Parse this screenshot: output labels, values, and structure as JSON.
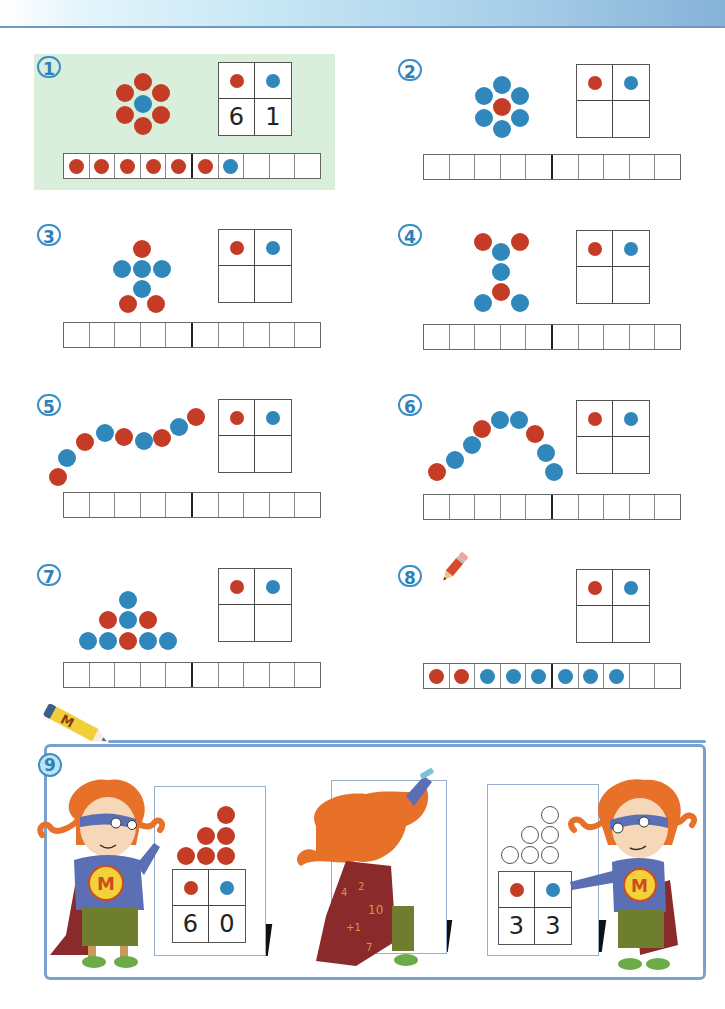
{
  "header": {
    "gradient_colors": [
      "#ffffff",
      "#c9e8f5",
      "#86b2d8"
    ]
  },
  "colors": {
    "red": "#c43c25",
    "blue": "#2f87bb",
    "highlight_bg": "#d9eedb",
    "number_circle": "#3a8fc7",
    "frame": "#7aa0cf"
  },
  "exercises": [
    {
      "number": "1",
      "highlighted": true,
      "pattern": "flower",
      "dots": "6 red + 1 blue",
      "table_header": [
        "red-dot",
        "blue-dot"
      ],
      "table_values": [
        "6",
        "1"
      ],
      "strip": [
        "red",
        "red",
        "red",
        "red",
        "red",
        "red",
        "blue",
        "",
        "",
        ""
      ]
    },
    {
      "number": "2",
      "highlighted": false,
      "pattern": "flower",
      "dots": "1 red + 6 blue",
      "table_header": [
        "red-dot",
        "blue-dot"
      ],
      "table_values": [
        "",
        ""
      ],
      "strip": [
        "",
        "",
        "",
        "",
        "",
        "",
        "",
        "",
        "",
        ""
      ]
    },
    {
      "number": "3",
      "highlighted": false,
      "pattern": "figure",
      "dots": "3 red + 4 blue",
      "table_header": [
        "red-dot",
        "blue-dot"
      ],
      "table_values": [
        "",
        ""
      ],
      "strip": [
        "",
        "",
        "",
        "",
        "",
        "",
        "",
        "",
        "",
        ""
      ]
    },
    {
      "number": "4",
      "highlighted": false,
      "pattern": "hourglass",
      "dots": "3 red + 4 blue",
      "table_header": [
        "red-dot",
        "blue-dot"
      ],
      "table_values": [
        "",
        ""
      ],
      "strip": [
        "",
        "",
        "",
        "",
        "",
        "",
        "",
        "",
        "",
        ""
      ]
    },
    {
      "number": "5",
      "highlighted": false,
      "pattern": "wave",
      "dots": "5 red + 4 blue",
      "table_header": [
        "red-dot",
        "blue-dot"
      ],
      "table_values": [
        "",
        ""
      ],
      "strip": [
        "",
        "",
        "",
        "",
        "",
        "",
        "",
        "",
        "",
        ""
      ]
    },
    {
      "number": "6",
      "highlighted": false,
      "pattern": "arc",
      "dots": "3 red + 6 blue",
      "table_header": [
        "red-dot",
        "blue-dot"
      ],
      "table_values": [
        "",
        ""
      ],
      "strip": [
        "",
        "",
        "",
        "",
        "",
        "",
        "",
        "",
        "",
        ""
      ]
    },
    {
      "number": "7",
      "highlighted": false,
      "pattern": "triangle",
      "dots": "3 red + 6 blue",
      "table_header": [
        "red-dot",
        "blue-dot"
      ],
      "table_values": [
        "",
        ""
      ],
      "strip": [
        "",
        "",
        "",
        "",
        "",
        "",
        "",
        "",
        "",
        ""
      ]
    },
    {
      "number": "8",
      "highlighted": false,
      "pattern": "draw",
      "icon": "pencil-icon",
      "table_header": [
        "red-dot",
        "blue-dot"
      ],
      "table_values": [
        "",
        ""
      ],
      "strip": [
        "red",
        "red",
        "blue",
        "blue",
        "blue",
        "blue",
        "blue",
        "blue",
        "",
        ""
      ]
    }
  ],
  "exercise9": {
    "number": "9",
    "boards": [
      {
        "dots": "6 red triangle",
        "table_values": [
          "6",
          "0"
        ]
      },
      {
        "dots": "blank (character drawing)",
        "table_values": []
      },
      {
        "dots": "6 empty circles triangle",
        "table_values": [
          "3",
          "3"
        ]
      }
    ],
    "crayon_letter": "M",
    "character_logo": "M",
    "cape_numbers": [
      "4",
      "2",
      "10",
      "+1",
      "=",
      "5",
      "7"
    ]
  }
}
